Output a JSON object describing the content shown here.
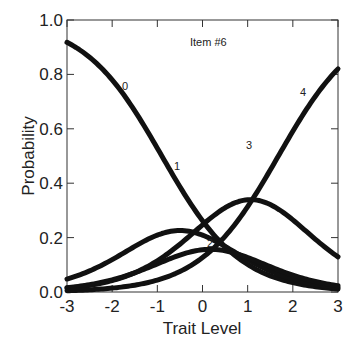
{
  "chart_data": {
    "type": "line",
    "title": "",
    "annotation": "Item #6",
    "xlabel": "Trait Level",
    "ylabel": "Probability",
    "xlim": [
      -3,
      3
    ],
    "ylim": [
      0,
      1
    ],
    "xticks": [
      -3,
      -2,
      -1,
      0,
      1,
      2,
      3
    ],
    "yticks": [
      0.0,
      0.2,
      0.4,
      0.6,
      0.8,
      1.0
    ],
    "xtick_labels": [
      "-3",
      "-2",
      "-1",
      "0",
      "1",
      "2",
      "3"
    ],
    "ytick_labels": [
      "0.0",
      "0.2",
      "0.4",
      "0.6",
      "0.8",
      "1.0"
    ],
    "grid": false,
    "legend": "inline curve labels",
    "x": [
      -3,
      -2,
      -1,
      0,
      1,
      2,
      3
    ],
    "series": [
      {
        "name": "0",
        "values": [
          0.92,
          0.78,
          0.44,
          0.26,
          0.07,
          0.02,
          0.0
        ]
      },
      {
        "name": "1",
        "values": [
          0.09,
          0.18,
          0.41,
          0.3,
          0.12,
          0.03,
          0.01
        ]
      },
      {
        "name": "2",
        "values": [
          0.0,
          0.02,
          0.1,
          0.22,
          0.19,
          0.06,
          0.01
        ]
      },
      {
        "name": "3",
        "values": [
          0.0,
          0.01,
          0.05,
          0.23,
          0.5,
          0.38,
          0.18
        ]
      },
      {
        "name": "4",
        "values": [
          0.0,
          0.0,
          0.01,
          0.11,
          0.31,
          0.58,
          0.82
        ]
      }
    ],
    "model": {
      "discrimination": 1.15,
      "thresholds": [
        -0.9,
        -0.1,
        0.45,
        1.68
      ]
    }
  },
  "labels": {
    "annotation": "Item #6",
    "xlabel": "Trait Level",
    "ylabel": "Probability",
    "curves": [
      "0",
      "1",
      "2",
      "3",
      "4"
    ]
  }
}
